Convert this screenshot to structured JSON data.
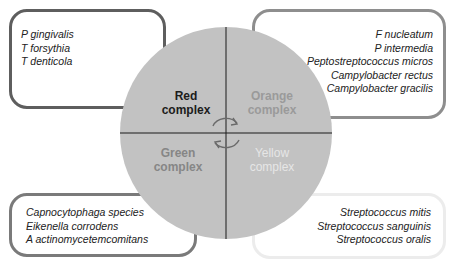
{
  "wheel": {
    "fill": "#c2c2c2",
    "quadrants": [
      {
        "label_line1": "Red",
        "label_line2": "complex",
        "color": "#1c1c1c"
      },
      {
        "label_line1": "Orange",
        "label_line2": "complex",
        "color": "#9a9a9a"
      },
      {
        "label_line1": "Green",
        "label_line2": "complex",
        "color": "#868686"
      },
      {
        "label_line1": "Yellow",
        "label_line2": "complex",
        "color": "#e6e6e6"
      }
    ],
    "center_icon": "cycle-arrows-icon"
  },
  "boxes": {
    "red": {
      "border_color": "#5e5e5e",
      "species": [
        "P gingivalis",
        "T forsythia",
        "T denticola"
      ]
    },
    "orange": {
      "border_color": "#8e8e8e",
      "species": [
        "F nucleatum",
        "P intermedia",
        "Peptostreptococcus micros",
        "Campylobacter rectus",
        "Campylobacter gracilis"
      ]
    },
    "green": {
      "border_color": "#7a7a7a",
      "species": [
        "Capnocytophaga species",
        "Eikenella corrodens",
        "A actinomycetemcomitans"
      ]
    },
    "yellow": {
      "border_color": "#ececec",
      "species": [
        "Streptococcus mitis",
        "Streptococcus sanguinis",
        "Streptococcus oralis"
      ]
    }
  }
}
